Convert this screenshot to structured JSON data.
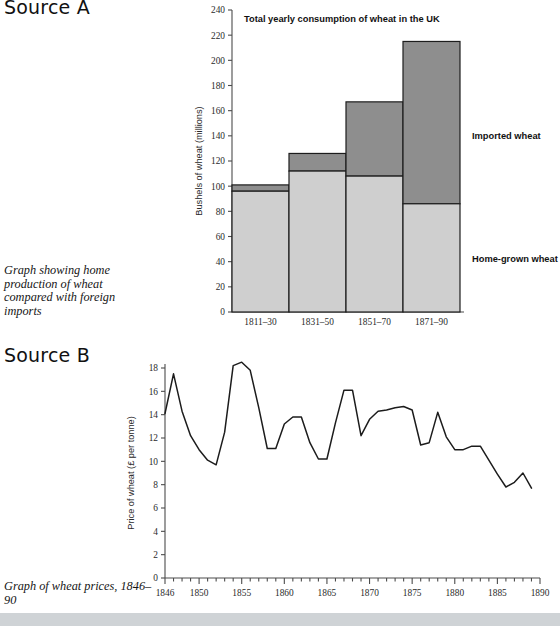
{
  "sections": {
    "source_a": {
      "heading": "Source A",
      "caption": "Graph showing home production of wheat compared with foreign imports"
    },
    "source_b": {
      "heading": "Source B",
      "caption": "Graph of wheat prices, 1846–90"
    }
  },
  "chart_data": [
    {
      "type": "bar",
      "id": "wheat-consumption-bar-chart",
      "title": "Total yearly consumption of wheat in the UK",
      "xlabel": "",
      "ylabel": "Bushels of wheat (millions)",
      "ylim": [
        0,
        240
      ],
      "ytick_step": 20,
      "yticks": [
        0,
        20,
        40,
        60,
        80,
        100,
        120,
        140,
        160,
        180,
        200,
        220,
        240
      ],
      "grid": false,
      "stacked": true,
      "legend": "inline-labels-right",
      "categories": [
        "1811–30",
        "1831–50",
        "1851–70",
        "1871–90"
      ],
      "series": [
        {
          "name": "Home-grown wheat",
          "color": "#cfcfcf",
          "values": [
            96,
            112,
            108,
            86
          ]
        },
        {
          "name": "Imported wheat",
          "color": "#8e8e8e",
          "values": [
            5,
            14,
            59,
            129
          ]
        }
      ],
      "totals": [
        101,
        126,
        167,
        215
      ],
      "annotations": [
        {
          "text": "Imported wheat",
          "x": "right-of-bar-4",
          "y": 140
        },
        {
          "text": "Home-grown wheat",
          "x": "right-of-bar-4",
          "y": 42
        }
      ]
    },
    {
      "type": "line",
      "id": "wheat-price-line-chart",
      "title": "",
      "xlabel": "",
      "ylabel": "Price of wheat (£ per tonne)",
      "xlim": [
        1846,
        1890
      ],
      "ylim": [
        0,
        18
      ],
      "ytick_step": 2,
      "yticks": [
        0,
        2,
        4,
        6,
        8,
        10,
        12,
        14,
        16,
        18
      ],
      "xticks_labelled": [
        1846,
        1850,
        1855,
        1860,
        1865,
        1870,
        1875,
        1880,
        1885,
        1890
      ],
      "xtick_minor_step": 1,
      "grid": false,
      "legend": "none",
      "series": [
        {
          "name": "Price of wheat",
          "color": "#1c1c1c",
          "x": [
            1846,
            1847,
            1848,
            1849,
            1850,
            1851,
            1852,
            1853,
            1854,
            1855,
            1856,
            1857,
            1858,
            1859,
            1860,
            1861,
            1862,
            1863,
            1864,
            1865,
            1866,
            1867,
            1868,
            1869,
            1870,
            1871,
            1872,
            1873,
            1874,
            1875,
            1876,
            1877,
            1878,
            1879,
            1880,
            1881,
            1882,
            1883,
            1884,
            1885,
            1886,
            1887,
            1888,
            1889
          ],
          "values": [
            14.1,
            17.5,
            14.3,
            12.2,
            11.0,
            10.1,
            9.7,
            12.5,
            18.2,
            18.5,
            17.8,
            14.6,
            11.1,
            11.1,
            13.2,
            13.8,
            13.8,
            11.6,
            10.2,
            10.2,
            13.3,
            16.1,
            16.1,
            12.2,
            13.6,
            14.3,
            14.4,
            14.6,
            14.7,
            14.4,
            11.4,
            11.6,
            14.2,
            12.1,
            11.0,
            11.0,
            11.3,
            11.3,
            10.1,
            8.9,
            7.8,
            8.2,
            9.0,
            7.7
          ]
        }
      ]
    }
  ]
}
